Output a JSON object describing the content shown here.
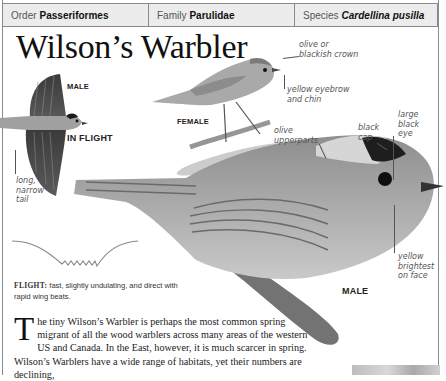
{
  "header": {
    "order_label": "Order",
    "order_value": "Passeriformes",
    "family_label": "Family",
    "family_value": "Parulidae",
    "species_label": "Species",
    "species_value": "Cardellina pusilla"
  },
  "title": "Wilson’s Warbler",
  "illustrations": {
    "flight_bird": {
      "sex_label": "MALE",
      "pose_label": "IN FLIGHT",
      "tail_note": [
        "long,",
        "narrow",
        "tail"
      ]
    },
    "female_bird": {
      "label": "FEMALE",
      "crown_note": [
        "olive or",
        "blackish crown"
      ],
      "eyebrow_note": [
        "yellow eyebrow",
        "and chin"
      ]
    },
    "male_bird": {
      "label": "MALE",
      "upperparts_note": [
        "olive",
        "upperparts"
      ],
      "cap_note": [
        "black",
        "cap"
      ],
      "eye_note": [
        "large",
        "black",
        "eye"
      ],
      "face_note": [
        "yellow",
        "brightest",
        "on face"
      ]
    }
  },
  "flight": {
    "key": "FLIGHT:",
    "description": "fast, slightly undulating, and direct with rapid wing beats."
  },
  "body": {
    "drop_cap": "T",
    "text": "he tiny Wilson’s Warbler is perhaps the most common spring migrant of all the wood warblers across many areas of the western US and Canada. In the East, however, it is much scarcer in spring. Wilson’s Warblers have a wide range of habitats, yet their numbers are declining,"
  },
  "colors": {
    "border": "#8a8a8a",
    "header_bg": "#ececec",
    "text": "#1a1a1a",
    "annotation": "#555555"
  }
}
